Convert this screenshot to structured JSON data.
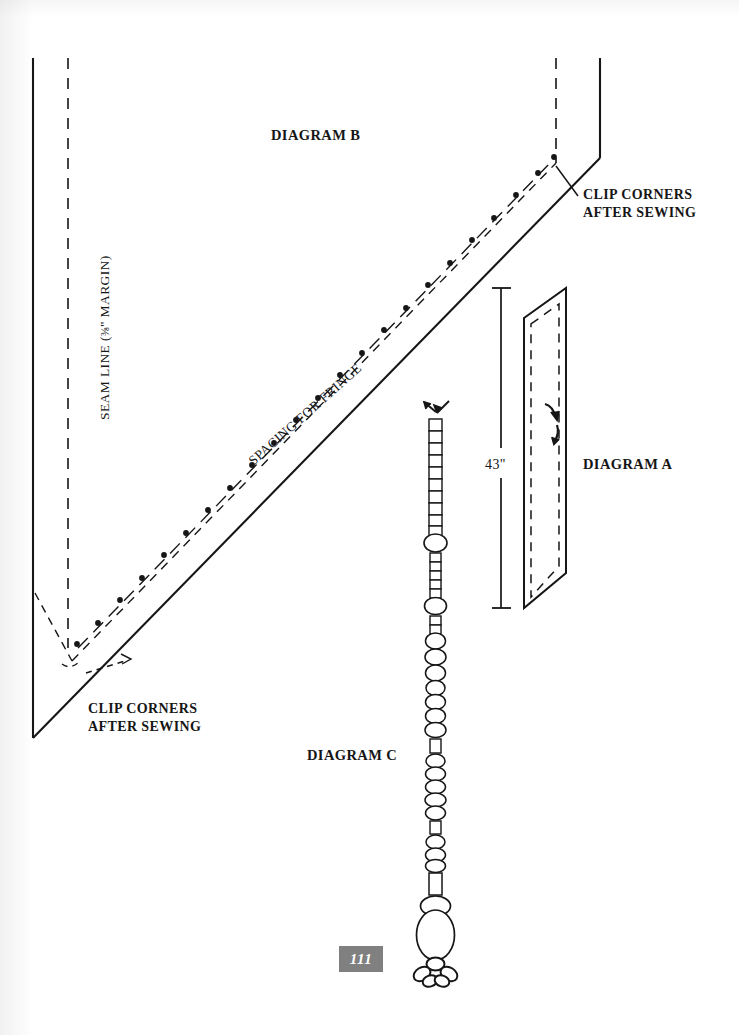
{
  "page": {
    "number": "111",
    "background_color": "#ffffff",
    "ink_color": "#161616"
  },
  "labels": {
    "diagram_b": "DIAGRAM B",
    "diagram_a": "DIAGRAM A",
    "diagram_c": "DIAGRAM C",
    "clip_corners_top": "CLIP CORNERS\nAFTER SEWING",
    "clip_corners_top_line1": "CLIP CORNERS",
    "clip_corners_top_line2": "AFTER SEWING",
    "clip_corners_bottom_line1": "CLIP CORNERS",
    "clip_corners_bottom_line2": "AFTER SEWING",
    "seam_line_prefix": "SEAM LINE (",
    "seam_line_fraction": "⅜",
    "seam_line_suffix": "\" MARGIN)",
    "spacing_for_fringe": "SPACING FOR FRINGE",
    "dimension_43": "43\""
  },
  "diagram_a": {
    "title": "DIAGRAM A",
    "dimension_label": "43\"",
    "shape": "parallelogram panel with dashed seam allowance line",
    "annotations": [
      "curved tick mark upper",
      "curved tick mark lower"
    ]
  },
  "diagram_b": {
    "title": "DIAGRAM B",
    "description": "large triangular shawl layout with solid cut edge, dashed seam line, and dash-dot fringe spacing line",
    "line_types": {
      "cut_edge": "solid",
      "seam_line": "dashed",
      "fringe_spacing": "dash-dot"
    },
    "callouts": [
      "CLIP CORNERS AFTER SEWING",
      "SEAM LINE (⅜\" MARGIN)",
      "SPACING FOR FRINGE"
    ]
  },
  "diagram_c": {
    "title": "DIAGRAM C",
    "description": "beaded tassel strand: column of square bugle beads interspersed with round and oval beads, finished with a large oval bead and a cluster of small beads",
    "bead_counts": {
      "square_beads_upper": 22,
      "round_beads": 18,
      "large_oval_final": 1,
      "bottom_cluster": 5
    }
  },
  "colors": {
    "ink": "#161616",
    "page_number_bg": "#808080",
    "page_number_fg": "#ffffff"
  }
}
